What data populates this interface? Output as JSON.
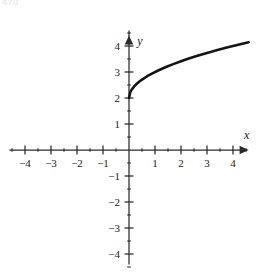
{
  "figure": {
    "corner_label": "470",
    "background_color": "#ffffff",
    "ink_color": "#1a1a1a"
  },
  "chart_data": {
    "type": "line",
    "title": "",
    "subtitle": "",
    "xlabel": "x",
    "ylabel": "y",
    "grid": false,
    "legend": null,
    "axis_style": "cartesian-arrows",
    "curve_color": "#141414",
    "xlim": [
      -4.6,
      4.6
    ],
    "ylim": [
      -4.4,
      4.4
    ],
    "x_major_ticks": [
      -4,
      -3,
      -2,
      -1,
      1,
      2,
      3,
      4
    ],
    "x_tick_labels": [
      "-4",
      "-3",
      "-2",
      "-1",
      "1",
      "2",
      "3",
      "4"
    ],
    "x_minor_ticks": [
      -4.5,
      -3.5,
      -2.5,
      -1.5,
      -0.5,
      0.5,
      1.5,
      2.5,
      3.5,
      4.5
    ],
    "y_major_ticks": [
      -4,
      -3,
      -2,
      -1,
      1,
      2,
      3,
      4
    ],
    "y_tick_labels": [
      "-4",
      "-3",
      "-2",
      "-1",
      "1",
      "2",
      "3",
      "4"
    ],
    "y_minor_ticks": [
      -4.5,
      -3.5,
      -2.5,
      -1.5,
      -0.5,
      0.5,
      1.5,
      2.5,
      3.5,
      4.5
    ],
    "origin_label": "",
    "series": [
      {
        "name": "y = sqrt(x) + 2",
        "domain": [
          0,
          4.6
        ],
        "endpoint_start": [
          0,
          2
        ],
        "endpoint_end": [
          4.6,
          4.14
        ],
        "x": [
          0,
          0.05,
          0.1,
          0.2,
          0.3,
          0.4,
          0.5,
          0.7,
          0.9,
          1.1,
          1.4,
          1.7,
          2.0,
          2.3,
          2.6,
          3.0,
          3.4,
          3.8,
          4.2,
          4.6
        ],
        "y": [
          2.0,
          2.224,
          2.316,
          2.447,
          2.548,
          2.632,
          2.707,
          2.837,
          2.949,
          3.049,
          3.183,
          3.304,
          3.414,
          3.517,
          3.612,
          3.732,
          3.844,
          3.949,
          4.049,
          4.145
        ]
      }
    ]
  }
}
